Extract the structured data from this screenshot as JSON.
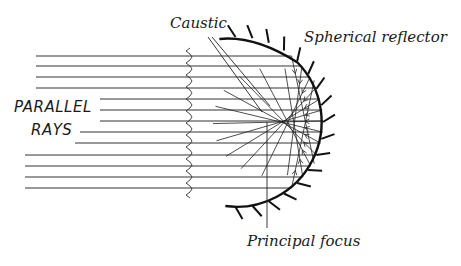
{
  "diagram": {
    "labels": {
      "caustic": "Caustic",
      "reflector": "Spherical reflector",
      "parallel": "PARALLEL",
      "rays": "RAYS",
      "focus": "Principal focus"
    },
    "colors": {
      "ink": "#1a1a1a",
      "background": "#ffffff"
    },
    "rays_y": [
      56,
      66,
      77,
      88,
      99,
      110,
      121,
      132,
      143,
      155,
      166,
      177,
      188
    ],
    "rays_x_start": [
      36,
      36,
      36,
      36,
      100,
      100,
      100,
      80,
      75,
      25,
      25,
      25,
      25
    ],
    "mirror": {
      "center_x": 238,
      "center_y": 122,
      "radius": 85
    },
    "focus_point": {
      "x": 268,
      "y": 122
    }
  }
}
